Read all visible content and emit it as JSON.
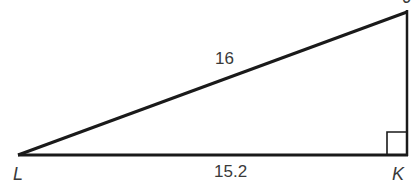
{
  "diagram": {
    "type": "right-triangle",
    "vertices": {
      "L": {
        "label": "L"
      },
      "K": {
        "label": "K"
      },
      "J": {
        "label": "J"
      }
    },
    "sides": {
      "hypotenuse_LJ": {
        "label": "16"
      },
      "base_LK": {
        "label": "15.2"
      }
    },
    "right_angle_at": "K",
    "colors": {
      "stroke": "#1a1a1a",
      "text": "#3a3a3a"
    }
  }
}
